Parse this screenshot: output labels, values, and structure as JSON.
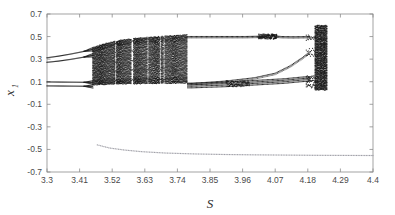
{
  "figure": {
    "background_color": "#ffffff",
    "point_color": "#1a1a1a",
    "lower_branch_color": "#9a9aa2",
    "frame_color": "#8c8c8c"
  },
  "chart_data": {
    "type": "scatter",
    "title": "",
    "subtitle": "",
    "xlabel": "S",
    "ylabel": "x",
    "ylabel_subscript": "1",
    "xlim": [
      3.3,
      4.4
    ],
    "ylim": [
      -0.7,
      0.7
    ],
    "grid": false,
    "legend": null,
    "xticks": [
      "3.3",
      "3.41",
      "3.52",
      "3.63",
      "3.74",
      "3.85",
      "3.96",
      "4.07",
      "4.18",
      "4.29",
      "4.4"
    ],
    "xtick_values": [
      3.3,
      3.41,
      3.52,
      3.63,
      3.74,
      3.85,
      3.96,
      4.07,
      4.18,
      4.29,
      4.4
    ],
    "yticks": [
      "0.7",
      "0.5",
      "0.3",
      "0.1",
      "-0.1",
      "-0.3",
      "-0.5",
      "-0.7"
    ],
    "ytick_values": [
      0.7,
      0.5,
      0.3,
      0.1,
      -0.1,
      -0.3,
      -0.5,
      -0.7
    ],
    "regions": [
      {
        "name": "period-4-left",
        "s_range": [
          3.3,
          3.455
        ],
        "branch_values": [
          {
            "s": 3.3,
            "x": [
              0.272,
              0.312,
              0.063,
              0.098
            ]
          },
          {
            "s": 3.34,
            "x": [
              0.283,
              0.327,
              0.062,
              0.097
            ]
          },
          {
            "s": 3.38,
            "x": [
              0.298,
              0.345,
              0.061,
              0.096
            ]
          },
          {
            "s": 3.42,
            "x": [
              0.316,
              0.366,
              0.06,
              0.095
            ]
          },
          {
            "s": 3.45,
            "x": [
              0.332,
              0.385,
              0.059,
              0.094
            ]
          }
        ]
      },
      {
        "name": "chaotic-band-main",
        "s_range": [
          3.455,
          3.775
        ],
        "upper_envelope": [
          {
            "s": 3.455,
            "x": 0.4
          },
          {
            "s": 3.5,
            "x": 0.44
          },
          {
            "s": 3.56,
            "x": 0.47
          },
          {
            "s": 3.63,
            "x": 0.49
          },
          {
            "s": 3.7,
            "x": 0.5
          },
          {
            "s": 3.775,
            "x": 0.515
          }
        ],
        "lower_envelope": [
          {
            "s": 3.455,
            "x": 0.075
          },
          {
            "s": 3.52,
            "x": 0.08
          },
          {
            "s": 3.63,
            "x": 0.085
          },
          {
            "s": 3.775,
            "x": 0.09
          }
        ]
      },
      {
        "name": "periodic-window-mid",
        "s_range": [
          3.775,
          4.19
        ],
        "branches": [
          {
            "name": "upper",
            "points": [
              {
                "s": 3.79,
                "x": 0.5
              },
              {
                "s": 3.88,
                "x": 0.5
              },
              {
                "s": 3.97,
                "x": 0.5
              },
              {
                "s": 4.03,
                "x": 0.503
              },
              {
                "s": 4.06,
                "x": 0.508
              },
              {
                "s": 4.09,
                "x": 0.5
              },
              {
                "s": 4.13,
                "x": 0.498
              },
              {
                "s": 4.19,
                "x": 0.5
              }
            ]
          },
          {
            "name": "rising-middle",
            "points": [
              {
                "s": 3.79,
                "x": 0.085
              },
              {
                "s": 3.9,
                "x": 0.105
              },
              {
                "s": 4.0,
                "x": 0.135
              },
              {
                "s": 4.07,
                "x": 0.175
              },
              {
                "s": 4.12,
                "x": 0.24
              },
              {
                "s": 4.16,
                "x": 0.31
              },
              {
                "s": 4.19,
                "x": 0.37
              }
            ]
          },
          {
            "name": "lower-bundle",
            "points": [
              {
                "s": 3.79,
                "x": 0.06
              },
              {
                "s": 3.9,
                "x": 0.07
              },
              {
                "s": 4.0,
                "x": 0.085
              },
              {
                "s": 4.1,
                "x": 0.1
              },
              {
                "s": 4.16,
                "x": 0.115
              },
              {
                "s": 4.19,
                "x": 0.12
              }
            ]
          }
        ]
      },
      {
        "name": "chaotic-burst-right",
        "s_range": [
          4.205,
          4.245
        ],
        "x_range": [
          0.03,
          0.595
        ]
      },
      {
        "name": "lower-attractor",
        "s_range": [
          3.47,
          4.4
        ],
        "points": [
          {
            "s": 3.47,
            "x": -0.46
          },
          {
            "s": 3.51,
            "x": -0.487
          },
          {
            "s": 3.56,
            "x": -0.505
          },
          {
            "s": 3.62,
            "x": -0.52
          },
          {
            "s": 3.7,
            "x": -0.532
          },
          {
            "s": 3.8,
            "x": -0.54
          },
          {
            "s": 3.9,
            "x": -0.545
          },
          {
            "s": 4.0,
            "x": -0.548
          },
          {
            "s": 4.1,
            "x": -0.55
          },
          {
            "s": 4.2,
            "x": -0.552
          },
          {
            "s": 4.3,
            "x": -0.553
          },
          {
            "s": 4.4,
            "x": -0.554
          }
        ]
      }
    ]
  }
}
